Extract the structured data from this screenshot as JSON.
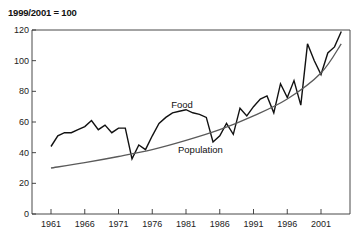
{
  "chart_data": {
    "type": "line",
    "title": "1999/2001 = 100",
    "xlabel": "",
    "ylabel": "",
    "ylim": [
      0,
      120
    ],
    "xlim": [
      1961,
      2004
    ],
    "grid": false,
    "legend": "inline labels",
    "y_ticks": [
      0,
      20,
      40,
      60,
      80,
      100,
      120
    ],
    "x_ticks": [
      1961,
      1966,
      1971,
      1976,
      1981,
      1986,
      1991,
      1996,
      2001
    ],
    "series": [
      {
        "name": "Food",
        "color": "#111111",
        "x": [
          1961,
          1962,
          1963,
          1964,
          1965,
          1966,
          1967,
          1968,
          1969,
          1970,
          1971,
          1972,
          1973,
          1974,
          1975,
          1976,
          1977,
          1978,
          1979,
          1980,
          1981,
          1982,
          1983,
          1984,
          1985,
          1986,
          1987,
          1988,
          1989,
          1990,
          1991,
          1992,
          1993,
          1994,
          1995,
          1996,
          1997,
          1998,
          1999,
          2000,
          2001,
          2002,
          2003,
          2004
        ],
        "values": [
          44,
          51,
          53,
          53,
          55,
          57,
          61,
          55,
          58,
          53,
          56,
          56,
          36,
          45,
          42,
          51,
          59,
          63,
          66,
          67,
          68,
          66,
          65,
          63,
          47,
          51,
          59,
          52,
          69,
          64,
          70,
          75,
          77,
          66,
          85,
          76,
          87,
          71,
          111,
          100,
          91,
          105,
          109,
          119
        ]
      },
      {
        "name": "Population",
        "color": "#5a5a5a",
        "x": [
          1961,
          1966,
          1971,
          1976,
          1981,
          1986,
          1991,
          1996,
          2001,
          2004
        ],
        "values": [
          30,
          33.5,
          37.5,
          42,
          48,
          55,
          64,
          75,
          92,
          111
        ]
      }
    ],
    "annotations": [
      {
        "text": "Food",
        "x": 1980,
        "y": 71
      },
      {
        "text": "Population",
        "x": 1981,
        "y": 42
      }
    ]
  }
}
